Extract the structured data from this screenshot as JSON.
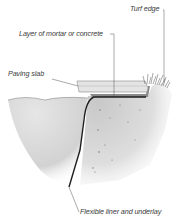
{
  "diagram": {
    "labels": {
      "turf_edge": "Turf edge",
      "mortar": "Layer of mortar or concrete",
      "paving_slab": "Paving slab",
      "liner": "Flexible liner and underlay"
    },
    "colors": {
      "water": "#d9d9d9",
      "soil": "#cfcfcf",
      "slab": "#e2e2e2",
      "liner": "#222222",
      "leader": "#555555"
    }
  }
}
